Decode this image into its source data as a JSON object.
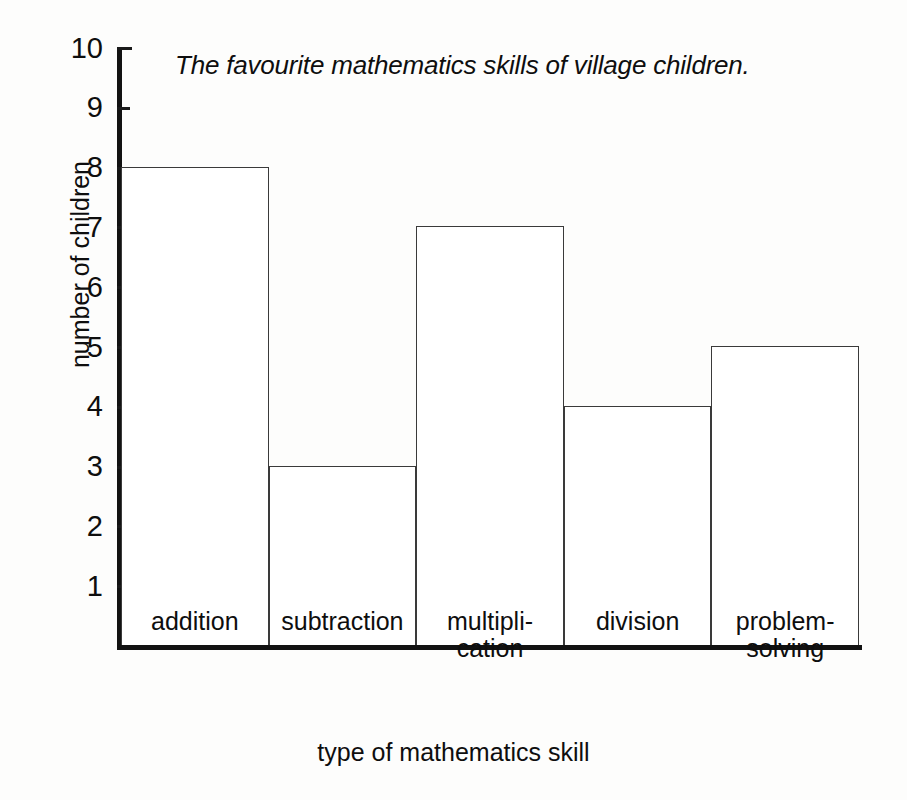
{
  "chart_data": {
    "type": "bar",
    "title": "The favourite mathematics skills of village children.",
    "xlabel": "type of mathematics skill",
    "ylabel": "number of children",
    "categories": [
      "addition",
      "subtraction",
      "multiplication",
      "division",
      "problem-solving"
    ],
    "category_display": [
      {
        "line1": "addition",
        "line2": ""
      },
      {
        "line1": "subtraction",
        "line2": ""
      },
      {
        "line1": "multipli-",
        "line2": "cation"
      },
      {
        "line1": "division",
        "line2": ""
      },
      {
        "line1": "problem-",
        "line2": "solving"
      }
    ],
    "values": [
      8,
      3,
      7,
      4,
      5
    ],
    "ylim": [
      0,
      10
    ],
    "ytick_labels": [
      "1",
      "2",
      "3",
      "4",
      "5",
      "6",
      "7",
      "8",
      "9",
      "10"
    ],
    "ytick_values": [
      1,
      2,
      3,
      4,
      5,
      6,
      7,
      8,
      9,
      10
    ],
    "grid": false,
    "legend": "none",
    "bar_style": "outline",
    "bar_gap": 0,
    "colors": {
      "bar_fill": "#ffffff",
      "bar_outline": "#3a3a3a",
      "axis": "#121212",
      "text": "#0e0e0e",
      "background": "#fdfdfc"
    }
  }
}
